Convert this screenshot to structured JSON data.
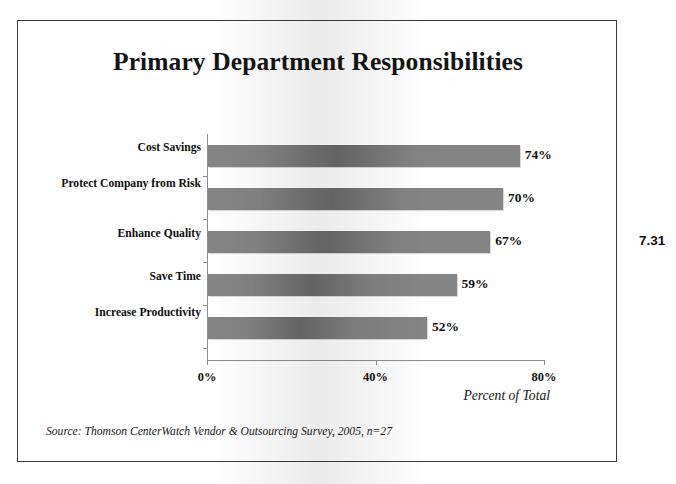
{
  "figure": {
    "number": "7.31",
    "title": "Primary Department Responsibilities",
    "source": "Source: Thomson CenterWatch Vendor & Outsourcing Survey, 2005, n=27"
  },
  "axis": {
    "x_title": "Percent of Total",
    "ticks": [
      "0%",
      "40%",
      "80%"
    ]
  },
  "chart_data": {
    "type": "bar",
    "orientation": "horizontal",
    "title": "Primary Department Responsibilities",
    "xlabel": "Percent of Total",
    "ylabel": "",
    "categories": [
      "Cost Savings",
      "Protect Company from Risk",
      "Enhance Quality",
      "Save Time",
      "Increase Productivity"
    ],
    "values": [
      74,
      70,
      67,
      59,
      52
    ],
    "value_labels": [
      "74%",
      "70%",
      "67%",
      "59%",
      "52%"
    ],
    "xlim": [
      0,
      80
    ],
    "xticks": [
      0,
      40,
      80
    ],
    "xtick_labels": [
      "0%",
      "40%",
      "80%"
    ],
    "grid": false,
    "legend": null,
    "bar_color": "#878787",
    "source": "Source: Thomson CenterWatch Vendor & Outsourcing Survey, 2005, n=27"
  }
}
